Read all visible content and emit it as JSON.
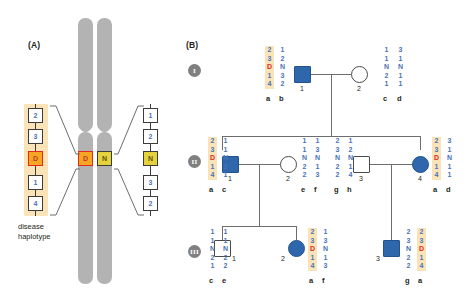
{
  "figure": {
    "panel_a": {
      "label": "(A)",
      "caption": "disease\nhaplotype",
      "caption_line1": "disease",
      "caption_line2": "haplotype",
      "disease_allele": "D",
      "normal_allele": "N",
      "left_haplotype": {
        "name": "disease haplotype",
        "highlighted": true,
        "markers": [
          "2",
          "3",
          "D",
          "1",
          "4"
        ]
      },
      "right_haplotype": {
        "name": "normal haplotype",
        "highlighted": false,
        "markers": [
          "1",
          "2",
          "N",
          "3",
          "2"
        ]
      },
      "chromosome_locus_left": "D",
      "chromosome_locus_right": "N"
    },
    "panel_b": {
      "label": "(B)",
      "generations": [
        {
          "numeral": "I"
        },
        {
          "numeral": "II"
        },
        {
          "numeral": "III"
        }
      ],
      "individuals": [
        {
          "id": "I-1",
          "number": "1",
          "sex": "male",
          "shape": "square",
          "affected": true,
          "haplotypes": [
            {
              "label": "a",
              "alleles": [
                "2",
                "3",
                "D",
                "1",
                "4"
              ],
              "highlighted": true
            },
            {
              "label": "b",
              "alleles": [
                "1",
                "2",
                "N",
                "3",
                "2"
              ],
              "highlighted": false
            }
          ]
        },
        {
          "id": "I-2",
          "number": "2",
          "sex": "female",
          "shape": "circle",
          "affected": false,
          "haplotypes": [
            {
              "label": "c",
              "alleles": [
                "1",
                "1",
                "N",
                "2",
                "1"
              ],
              "highlighted": false
            },
            {
              "label": "d",
              "alleles": [
                "3",
                "1",
                "N",
                "1",
                "1"
              ],
              "highlighted": false
            }
          ]
        },
        {
          "id": "II-1",
          "number": "1",
          "sex": "male",
          "shape": "square",
          "affected": true,
          "haplotypes": [
            {
              "label": "a",
              "alleles": [
                "2",
                "3",
                "D",
                "1",
                "4"
              ],
              "highlighted": true
            },
            {
              "label": "c",
              "alleles": [
                "1",
                "1",
                "N",
                "2",
                "1"
              ],
              "highlighted": false
            }
          ]
        },
        {
          "id": "II-2",
          "number": "2",
          "sex": "female",
          "shape": "circle",
          "affected": false,
          "haplotypes": [
            {
              "label": "e",
              "alleles": [
                "1",
                "1",
                "N",
                "2",
                "2"
              ],
              "highlighted": false
            },
            {
              "label": "f",
              "alleles": [
                "1",
                "3",
                "N",
                "1",
                "3"
              ],
              "highlighted": false
            }
          ]
        },
        {
          "id": "II-3",
          "number": "3",
          "sex": "male",
          "shape": "square",
          "affected": false,
          "haplotypes": [
            {
              "label": "g",
              "alleles": [
                "2",
                "3",
                "N",
                "2",
                "2"
              ],
              "highlighted": false
            },
            {
              "label": "h",
              "alleles": [
                "1",
                "2",
                "N",
                "1",
                "4"
              ],
              "highlighted": false
            }
          ]
        },
        {
          "id": "II-4",
          "number": "4",
          "sex": "female",
          "shape": "circle",
          "affected": true,
          "haplotypes": [
            {
              "label": "a",
              "alleles": [
                "2",
                "3",
                "D",
                "1",
                "4"
              ],
              "highlighted": true
            },
            {
              "label": "d",
              "alleles": [
                "3",
                "1",
                "N",
                "1",
                "1"
              ],
              "highlighted": false
            }
          ]
        },
        {
          "id": "III-1",
          "number": "1",
          "sex": "male",
          "shape": "square",
          "affected": false,
          "haplotypes": [
            {
              "label": "c",
              "alleles": [
                "1",
                "1",
                "N",
                "2",
                "1"
              ],
              "highlighted": false
            },
            {
              "label": "e",
              "alleles": [
                "1",
                "1",
                "N",
                "2",
                "2"
              ],
              "highlighted": false
            }
          ]
        },
        {
          "id": "III-2",
          "number": "2",
          "sex": "female",
          "shape": "circle",
          "affected": true,
          "haplotypes": [
            {
              "label": "a",
              "alleles": [
                "2",
                "3",
                "D",
                "1",
                "4"
              ],
              "highlighted": true
            },
            {
              "label": "f",
              "alleles": [
                "1",
                "3",
                "N",
                "1",
                "3"
              ],
              "highlighted": false
            }
          ]
        },
        {
          "id": "III-3",
          "number": "3",
          "sex": "male",
          "shape": "square",
          "affected": true,
          "haplotypes": [
            {
              "label": "g",
              "alleles": [
                "2",
                "3",
                "N",
                "2",
                "2"
              ],
              "highlighted": false
            },
            {
              "label": "a",
              "alleles": [
                "2",
                "3",
                "D",
                "1",
                "4"
              ],
              "highlighted": true
            }
          ]
        }
      ]
    },
    "colors": {
      "affected": "#2f67ad",
      "disease_allele": "#e1291c",
      "marker_text": "#4a72b8",
      "highlight_band": "#fbe3b8",
      "chromosome": "#b3b3b3",
      "d_box": "#f5a623",
      "n_box": "#e6d23c",
      "generation_badge": "#808080",
      "pedigree_line": "#6d6d6d"
    }
  }
}
